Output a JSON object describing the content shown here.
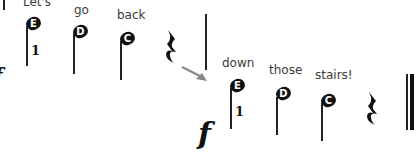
{
  "lyrics": [
    "Let's",
    "go",
    "back",
    "down",
    "those",
    "stairs!"
  ],
  "notes": [
    "E",
    "D",
    "C",
    "E",
    "D",
    "C"
  ],
  "fingerings": [
    "1",
    "1"
  ],
  "dynamics": [
    "f",
    "f"
  ],
  "icons": {
    "rest": "quarter-rest-icon",
    "arrow": "arrow-icon"
  }
}
